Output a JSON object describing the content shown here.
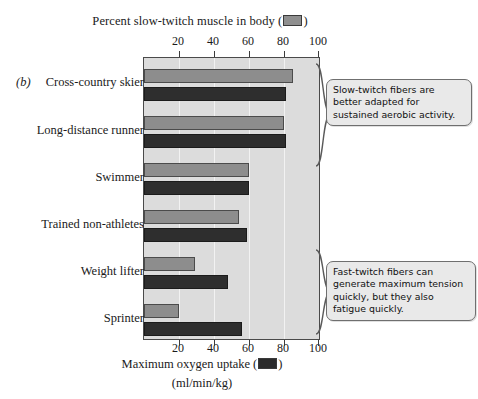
{
  "panel": {
    "letter": "(b)"
  },
  "top_axis": {
    "title_prefix": "Percent slow-twitch muscle in body (",
    "title_suffix": ")",
    "ticks": [
      "20",
      "40",
      "60",
      "80",
      "100"
    ]
  },
  "bottom_axis": {
    "title_prefix": "Maximum oxygen uptake (",
    "title_suffix": ")",
    "subtitle": "(ml/min/kg)",
    "ticks": [
      "20",
      "40",
      "60",
      "80",
      "100"
    ]
  },
  "categories": [
    "Cross-country skier",
    "Long-distance runner",
    "Swimmer",
    "Trained non-athletes",
    "Weight lifter",
    "Sprinter"
  ],
  "callouts": [
    {
      "id": "slow-twitch",
      "text": "Slow-twitch fibers are better adapted for sustained aerobic activity."
    },
    {
      "id": "fast-twitch",
      "text": "Fast-twitch fibers can generate maximum tension quickly, but they also fatigue quickly."
    }
  ],
  "colors": {
    "slow_twitch_bar": "#8d8d8d",
    "max_oxygen_bar": "#2e2e2e",
    "plot_background": "#dcdcdc",
    "gridline": "#f2f2f2",
    "axis": "#3c3c3c"
  },
  "chart_data": {
    "type": "bar",
    "orientation": "horizontal",
    "title": "",
    "categories": [
      "Cross-country skier",
      "Long-distance runner",
      "Swimmer",
      "Trained non-athletes",
      "Weight lifter",
      "Sprinter"
    ],
    "series": [
      {
        "name": "Percent slow-twitch muscle in body",
        "axis": "top",
        "unit": "%",
        "color": "#8d8d8d",
        "values": [
          85,
          80,
          60,
          54,
          29,
          20
        ]
      },
      {
        "name": "Maximum oxygen uptake",
        "axis": "bottom",
        "unit": "ml/min/kg",
        "color": "#2e2e2e",
        "values": [
          81,
          81,
          60,
          59,
          48,
          56
        ]
      }
    ],
    "xlabel": "Percent slow-twitch muscle in body / Maximum oxygen uptake (ml/min/kg)",
    "ylabel": "",
    "xlim": [
      0,
      100
    ],
    "xticks": [
      20,
      40,
      60,
      80,
      100
    ],
    "grid": true,
    "legend": "inline-swatch-in-axis-title"
  }
}
